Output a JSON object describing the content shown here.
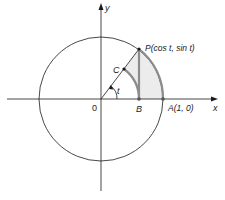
{
  "diagram": {
    "colors": {
      "line": "#1a1a1a",
      "highlight": "#8c8c8c",
      "shade": "#ececec",
      "background": "#ffffff"
    },
    "geometry": {
      "origin": [
        101,
        99
      ],
      "radius": 62,
      "angle_t_degrees": 53
    },
    "labels": {
      "x_axis": "x",
      "y_axis": "y",
      "origin": "0",
      "angle": "t",
      "point_P": "P(cos t, sin t)",
      "point_C": "C",
      "point_B": "B",
      "point_A": "A(1, 0)"
    }
  }
}
